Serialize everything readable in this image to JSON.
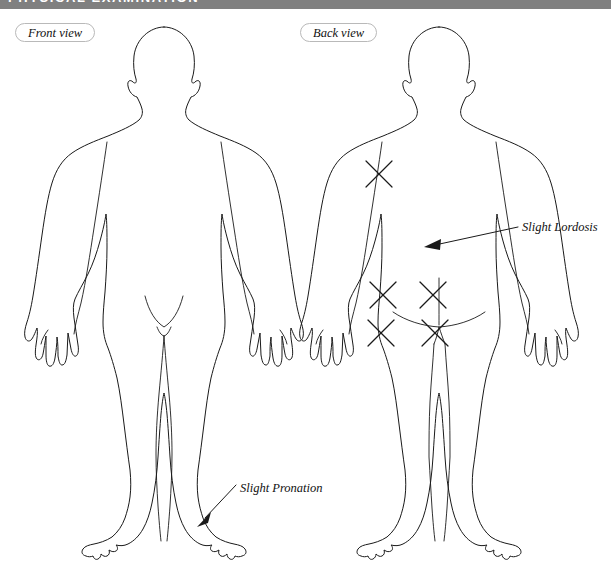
{
  "header": {
    "title": "PHYSICAL EXAMINATION",
    "background_color": "#808080",
    "text_color": "#ffffff"
  },
  "figures": {
    "front": {
      "view_label": "Front view",
      "marks": []
    },
    "back": {
      "view_label": "Back view",
      "marks": [
        {
          "name": "upper-back-left",
          "cx": 379,
          "cy": 174,
          "size": 14
        },
        {
          "name": "gluteal-upper-left",
          "cx": 383,
          "cy": 295,
          "size": 14
        },
        {
          "name": "gluteal-upper-right",
          "cx": 433,
          "cy": 295,
          "size": 14
        },
        {
          "name": "gluteal-lower-left",
          "cx": 381,
          "cy": 333,
          "size": 14
        },
        {
          "name": "gluteal-lower-right",
          "cx": 435,
          "cy": 333,
          "size": 14
        }
      ]
    }
  },
  "annotations": [
    {
      "name": "slight-lordosis",
      "text": "Slight Lordosis",
      "target": "lower back, back view"
    },
    {
      "name": "slight-pronation",
      "text": "Slight Pronation",
      "target": "left ankle, front view"
    }
  ],
  "colors": {
    "outline": "#1a1a1a",
    "pill_border": "#b9b9b9",
    "page_background": "#ffffff"
  }
}
